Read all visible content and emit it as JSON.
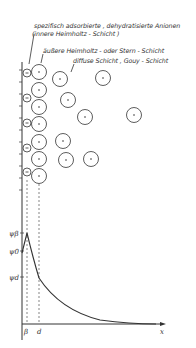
{
  "labels": {
    "specific_adsorbed": "spezifisch adsorbierte , dehydratisierte Anionen",
    "inner_helmholtz": "(innere Heimholtz - Schicht )",
    "outer_helmholtz": "äußere Heimholtz - oder Stern - Schicht",
    "diffuse_layer": "diffuse Schicht , Gouy - Schicht"
  },
  "axis": {
    "psi_beta": "ψβ",
    "psi_0": "ψ0",
    "psi_d": "ψd",
    "x_beta": "β",
    "x_d": "d",
    "x_axis": "x"
  },
  "colors": {
    "line": "#333333",
    "text": "#333333",
    "background": "#ffffff"
  }
}
